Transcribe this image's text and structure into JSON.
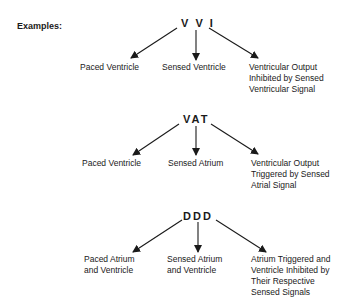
{
  "heading": "Examples:",
  "groups": [
    {
      "code": "V V I",
      "labels": [
        "Paced Ventricle",
        "Sensed Ventricle",
        "Ventricular Output\nInhibited by Sensed\nVentricular Signal"
      ]
    },
    {
      "code": "VAT",
      "labels": [
        "Paced Ventricle",
        "Sensed Atrium",
        "Ventricular Output\nTriggered by Sensed\nAtrial Signal"
      ]
    },
    {
      "code": "DDD",
      "labels": [
        "Paced Atrium\nand Ventricle",
        "Sensed Atrium\nand Ventricle",
        "Atrium Triggered and\nVentricle Inhibited by\nTheir Respective\nSensed Signals"
      ]
    }
  ]
}
